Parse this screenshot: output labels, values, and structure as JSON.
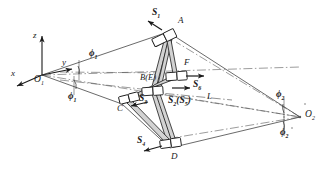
{
  "figure": {
    "kind": "spatial-linkage-kinematic-diagram",
    "background": "#ffffff",
    "stroke_color": "#1a1a1a",
    "link_fill": "#c9c9c9"
  },
  "frame": {
    "origin_label": "O",
    "origin_sub": "1",
    "axis_x": "x",
    "axis_y": "y",
    "axis_z": "z"
  },
  "pole": {
    "label": "O",
    "sub": "2"
  },
  "angles": {
    "phi1_upper": "ϕ",
    "phi1_upper_sub": "1",
    "phi1_lower": "ϕ",
    "phi1_lower_sub": "1",
    "phi2_upper": "ϕ",
    "phi2_upper_sub": "2",
    "phi2_lower": "ϕ",
    "phi2_lower_sub": "2"
  },
  "joints": {
    "a": "A",
    "be": "B(E)",
    "c": "C",
    "d": "D",
    "f": "F"
  },
  "screws": {
    "s1": "S",
    "s1_sub": "1",
    "s2": "S",
    "s2_sub": "2",
    "s2_paren": "(S",
    "s2_paren_sub": "5",
    "s2_paren_close": ")",
    "s3": "S",
    "s3_sub": "3",
    "s4": "S",
    "s4_sub": "4",
    "s6": "S",
    "s6_sub": "6"
  },
  "lines": {
    "l": "L"
  }
}
